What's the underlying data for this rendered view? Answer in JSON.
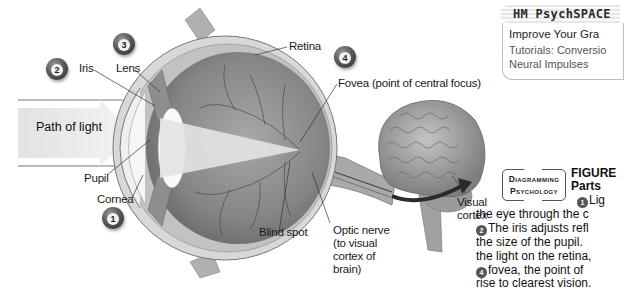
{
  "diagram": {
    "badges": [
      {
        "number": "1",
        "for": "Cornea"
      },
      {
        "number": "2",
        "for": "Iris"
      },
      {
        "number": "3",
        "for": "Lens"
      },
      {
        "number": "4",
        "for": "Fovea"
      }
    ],
    "labels": {
      "iris": "Iris",
      "lens": "Lens",
      "retina": "Retina",
      "fovea": "Fovea (point of central focus)",
      "path_of_light": "Path of light",
      "pupil": "Pupil",
      "cornea": "Cornea",
      "blind_spot": "Blind spot",
      "optic_nerve": [
        "Optic nerve",
        "(to visual",
        "cortex of",
        "brain)"
      ],
      "visual_cortex": [
        "Visual",
        "cortex"
      ]
    },
    "icons": [
      "eye-cross-section-illustration",
      "brain-illustration",
      "curved-arrow-icon",
      "number-badge-icon"
    ]
  },
  "sidebar_box": {
    "header": "HM PsychSPACE",
    "line1": "Improve Your Gra",
    "line2": "Tutorials: Conversio",
    "line3": "Neural Impulses"
  },
  "figure": {
    "tag_line1": "Diagramming",
    "tag_line2": "Psychology",
    "title": "FIGURE",
    "subtitle": "Parts",
    "caption": [
      {
        "badge": "1",
        "text": "Lig"
      },
      {
        "badge": "",
        "text": "the eye through the c"
      },
      {
        "badge": "2",
        "text": "The iris adjusts refl"
      },
      {
        "badge": "",
        "text": "the size of the pupil. "
      },
      {
        "badge": "",
        "text": "the light on the retina,"
      },
      {
        "badge": "4",
        "text": "fovea, the point of"
      },
      {
        "badge": "",
        "text": "rise to clearest vision."
      }
    ]
  },
  "colors": {
    "badge_dark": "#3a3a3a",
    "eye_interior": "#8a8a8a",
    "light_path": "#ececec",
    "brain": "#9c9c9c"
  }
}
